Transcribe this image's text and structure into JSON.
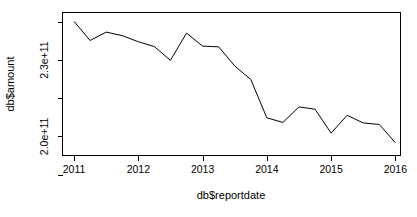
{
  "chart_data": {
    "type": "line",
    "title": "",
    "xlabel": "db$reportdate",
    "ylabel": "db$amount",
    "grid": false,
    "legend": null,
    "xlim": [
      2010.82,
      2016.08
    ],
    "ylim": [
      192500000000.0,
      248700000000.0
    ],
    "x_tick_labels": [
      "2011",
      "2012",
      "2013",
      "2014",
      "2015",
      "2016"
    ],
    "x_tick_values": [
      2011,
      2012,
      2013,
      2014,
      2015,
      2016
    ],
    "y_tick_labels": [
      "",
      "2.3e+11",
      "",
      "2.0e+11",
      ""
    ],
    "y_tick_values": [
      245000000000.0,
      230000000000.0,
      215000000000.0,
      200000000000.0,
      185000000000.0
    ],
    "y_labeled_ticks": [
      "2.3e+11",
      "2.0e+11"
    ],
    "line_color": "#000000",
    "x": [
      2011.0,
      2011.25,
      2011.5,
      2011.75,
      2012.0,
      2012.25,
      2012.5,
      2012.75,
      2013.0,
      2013.25,
      2013.5,
      2013.75,
      2014.0,
      2014.25,
      2014.5,
      2014.75,
      2015.0,
      2015.25,
      2015.5,
      2015.75,
      2016.0
    ],
    "values": [
      245200000000.0,
      237700000000.0,
      241000000000.0,
      239600000000.0,
      237200000000.0,
      235300000000.0,
      229900000000.0,
      240600000000.0,
      235500000000.0,
      235200000000.0,
      227700000000.0,
      222400000000.0,
      207300000000.0,
      205500000000.0,
      211600000000.0,
      210700000000.0,
      201300000000.0,
      208300000000.0,
      205300000000.0,
      204700000000.0,
      197500000000.0
    ]
  },
  "labels": {
    "x_axis_title": "db$reportdate",
    "y_axis_title": "db$amount"
  }
}
